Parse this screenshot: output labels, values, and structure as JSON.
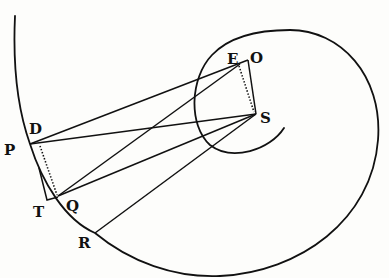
{
  "figure": {
    "colors": {
      "ink": "#111111",
      "paper": "#fdfdfb"
    },
    "points": {
      "P": {
        "label": "P",
        "x": 30,
        "y": 144
      },
      "D": {
        "label": "D",
        "x": 32,
        "y": 142
      },
      "T": {
        "label": "T",
        "x": 47,
        "y": 200
      },
      "Q": {
        "label": "Q",
        "x": 58,
        "y": 196
      },
      "R": {
        "label": "R",
        "x": 95,
        "y": 233
      },
      "E": {
        "label": "E",
        "x": 239,
        "y": 64
      },
      "O": {
        "label": "O",
        "x": 248,
        "y": 60
      },
      "S": {
        "label": "S",
        "x": 256,
        "y": 114
      }
    },
    "labels": {
      "D": "D",
      "P": "P",
      "T": "T",
      "Q": "Q",
      "R": "R",
      "E": "E",
      "O": "O",
      "S": "S"
    }
  }
}
